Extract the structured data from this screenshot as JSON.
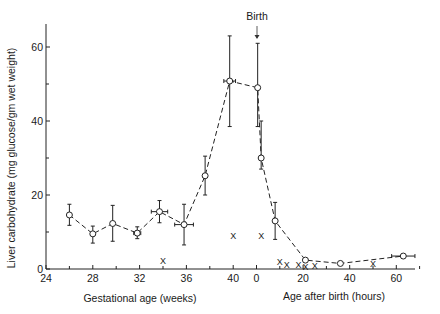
{
  "chart_data": {
    "type": "line",
    "title": "",
    "ylabel": "Liver carbohydrate (mg glucose/gm wet weight)",
    "xlabel_left": "Gestational age (weeks)",
    "xlabel_right": "Age after birth (hours)",
    "annotation": "Birth",
    "ylim": [
      0,
      66
    ],
    "yticks": [
      0,
      20,
      40,
      60
    ],
    "yticks_minor": [
      10,
      30,
      50
    ],
    "x_left_ticks": [
      24,
      28,
      32,
      36,
      40
    ],
    "x_left_minor": [
      26,
      30,
      34,
      38
    ],
    "x_right_ticks": [
      0,
      20,
      40,
      60
    ],
    "x_right_minor": [
      10,
      30,
      50,
      70
    ],
    "grid": false,
    "series": [
      {
        "name": "Mean liver carbohydrate",
        "style": "dashed line with open circles and error bars",
        "points": [
          {
            "axis": "weeks",
            "x": 26.0,
            "y": 14.6,
            "err_low": 11.8,
            "err_high": 17.5
          },
          {
            "axis": "weeks",
            "x": 28.0,
            "y": 9.5,
            "err_low": 7.0,
            "err_high": 11.6
          },
          {
            "axis": "weeks",
            "x": 29.7,
            "y": 12.3,
            "err_low": 7.5,
            "err_high": 17.2
          },
          {
            "axis": "weeks",
            "x": 31.8,
            "y": 9.7,
            "err_low": 8.2,
            "err_high": 11.4,
            "xerr": 0.3
          },
          {
            "axis": "weeks",
            "x": 33.7,
            "y": 15.5,
            "err_low": 12.5,
            "err_high": 18.5,
            "xerr": 0.7
          },
          {
            "axis": "weeks",
            "x": 35.8,
            "y": 12.0,
            "err_low": 6.5,
            "err_high": 17.5,
            "xerr": 0.8
          },
          {
            "axis": "weeks",
            "x": 37.6,
            "y": 25.2,
            "err_low": 20.0,
            "err_high": 30.5
          },
          {
            "axis": "weeks",
            "x": 39.7,
            "y": 50.8,
            "err_low": 38.5,
            "err_high": 63.0,
            "xerr": 0.5
          },
          {
            "axis": "hours",
            "x": 0.5,
            "y": 49.0,
            "err_low": 38.5,
            "err_high": 61.0
          },
          {
            "axis": "hours",
            "x": 2.0,
            "y": 30.0,
            "err_low": 27.0,
            "err_high": 40.0
          },
          {
            "axis": "hours",
            "x": 8.0,
            "y": 13.0,
            "err_low": 8.0,
            "err_high": 18.0
          },
          {
            "axis": "hours",
            "x": 21.0,
            "y": 2.4
          },
          {
            "axis": "hours",
            "x": 36.0,
            "y": 1.5
          },
          {
            "axis": "hours",
            "x": 63.0,
            "y": 3.5,
            "xerr": 5.0
          }
        ]
      },
      {
        "name": "Individual values (x markers)",
        "style": "x markers",
        "points": [
          {
            "axis": "weeks",
            "x": 34.0,
            "y": 2.2
          },
          {
            "axis": "weeks",
            "x": 40.0,
            "y": 9.0
          },
          {
            "axis": "hours",
            "x": 2.0,
            "y": 9.0
          },
          {
            "axis": "hours",
            "x": 10.0,
            "y": 2.0
          },
          {
            "axis": "hours",
            "x": 13.0,
            "y": 1.3
          },
          {
            "axis": "hours",
            "x": 18.0,
            "y": 1.3
          },
          {
            "axis": "hours",
            "x": 21.0,
            "y": 0.8
          },
          {
            "axis": "hours",
            "x": 25.0,
            "y": 1.0
          },
          {
            "axis": "hours",
            "x": 50.0,
            "y": 1.5
          }
        ]
      }
    ]
  },
  "labels": {
    "ylabel": "Liver carbohydrate (mg glucose/gm wet weight)",
    "xlabel_left": "Gestational age (weeks)",
    "xlabel_right": "Age after birth (hours)",
    "birth": "Birth",
    "marker_x": "X"
  }
}
